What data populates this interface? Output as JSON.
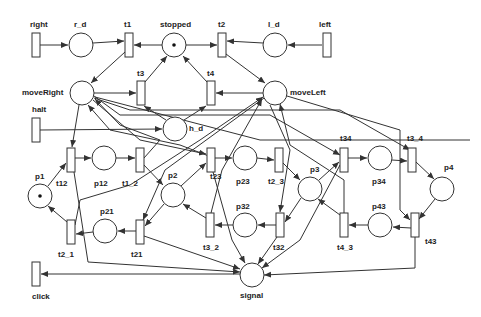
{
  "diagram": {
    "type": "petri-net",
    "colors": {
      "stroke": "#333333",
      "fill": "#ffffff",
      "text": "#222222",
      "token": "#111111"
    },
    "places": [
      {
        "id": "r_d",
        "label": "r_d",
        "cx": 81,
        "cy": 45,
        "tokens": 0
      },
      {
        "id": "stopped",
        "label": "stopped",
        "cx": 174,
        "cy": 45,
        "tokens": 1
      },
      {
        "id": "l_d",
        "label": "l_d",
        "cx": 275,
        "cy": 45,
        "tokens": 0
      },
      {
        "id": "moveRight",
        "label": "moveRight",
        "cx": 82,
        "cy": 93,
        "tokens": 0
      },
      {
        "id": "moveLeft",
        "label": "moveLeft",
        "cx": 275,
        "cy": 93,
        "tokens": 0
      },
      {
        "id": "h_d",
        "label": "h_d",
        "cx": 175,
        "cy": 129,
        "tokens": 0
      },
      {
        "id": "p12",
        "label": "p12",
        "cx": 104,
        "cy": 158,
        "tokens": 0
      },
      {
        "id": "p23",
        "label": "p23",
        "cx": 245,
        "cy": 158,
        "tokens": 0
      },
      {
        "id": "p34",
        "label": "p34",
        "cx": 380,
        "cy": 158,
        "tokens": 0
      },
      {
        "id": "p1",
        "label": "p1",
        "cx": 40,
        "cy": 196,
        "tokens": 1
      },
      {
        "id": "p2",
        "label": "p2",
        "cx": 173,
        "cy": 195,
        "tokens": 0
      },
      {
        "id": "p3",
        "label": "p3",
        "cx": 310,
        "cy": 189,
        "tokens": 0
      },
      {
        "id": "p4",
        "label": "p4",
        "cx": 442,
        "cy": 189,
        "tokens": 0
      },
      {
        "id": "p21",
        "label": "p21",
        "cx": 105,
        "cy": 231,
        "tokens": 0
      },
      {
        "id": "p32",
        "label": "p32",
        "cx": 245,
        "cy": 225,
        "tokens": 0
      },
      {
        "id": "p43",
        "label": "p43",
        "cx": 380,
        "cy": 225,
        "tokens": 0
      },
      {
        "id": "signal",
        "label": "signal",
        "cx": 252,
        "cy": 275,
        "tokens": 0
      }
    ],
    "transitions": [
      {
        "id": "right",
        "label": "right",
        "x": 32,
        "y": 33
      },
      {
        "id": "t1",
        "label": "t1",
        "x": 125,
        "y": 33
      },
      {
        "id": "t2",
        "label": "t2",
        "x": 218,
        "y": 33
      },
      {
        "id": "left",
        "label": "left",
        "x": 323,
        "y": 33
      },
      {
        "id": "t3",
        "label": "t3",
        "x": 137,
        "y": 81
      },
      {
        "id": "t4",
        "label": "t4",
        "x": 207,
        "y": 81
      },
      {
        "id": "halt",
        "label": "halt",
        "x": 32,
        "y": 118
      },
      {
        "id": "t12",
        "label": "t12",
        "x": 67,
        "y": 148
      },
      {
        "id": "t1_2",
        "label": "t1_2",
        "x": 136,
        "y": 148
      },
      {
        "id": "t23",
        "label": "t23",
        "x": 207,
        "y": 148
      },
      {
        "id": "t2_3",
        "label": "t2_3",
        "x": 275,
        "y": 148
      },
      {
        "id": "t34",
        "label": "t34",
        "x": 340,
        "y": 148
      },
      {
        "id": "t3_4",
        "label": "t3_4",
        "x": 408,
        "y": 148
      },
      {
        "id": "t2_1",
        "label": "t2_1",
        "x": 67,
        "y": 220
      },
      {
        "id": "t21",
        "label": "t21",
        "x": 136,
        "y": 220
      },
      {
        "id": "t3_2",
        "label": "t3_2",
        "x": 206,
        "y": 213
      },
      {
        "id": "t32",
        "label": "t32",
        "x": 276,
        "y": 213
      },
      {
        "id": "t4_3",
        "label": "t4_3",
        "x": 340,
        "y": 213
      },
      {
        "id": "t43",
        "label": "t43",
        "x": 411,
        "y": 213
      },
      {
        "id": "click",
        "label": "click",
        "x": 32,
        "y": 262
      }
    ]
  },
  "labels": {
    "right": "right",
    "r_d": "r_d",
    "t1": "t1",
    "stopped": "stopped",
    "t2": "t2",
    "l_d": "l_d",
    "left": "left",
    "moveRight": "moveRight",
    "t3": "t3",
    "t4": "t4",
    "moveLeft": "moveLeft",
    "halt": "halt",
    "h_d": "h_d",
    "t12": "t12",
    "p12": "p12",
    "t1_2": "t1_2",
    "t23": "t23",
    "p23": "p23",
    "t2_3": "t2_3",
    "t34": "t34",
    "p34": "p34",
    "t3_4": "t3_4",
    "p1": "p1",
    "p2": "p2",
    "p3": "p3",
    "p4": "p4",
    "t2_1": "t2_1",
    "p21": "p21",
    "t21": "t21",
    "t3_2": "t3_2",
    "p32": "p32",
    "t32": "t32",
    "t4_3": "t4_3",
    "p43": "p43",
    "t43": "t43",
    "click": "click",
    "signal": "signal"
  }
}
